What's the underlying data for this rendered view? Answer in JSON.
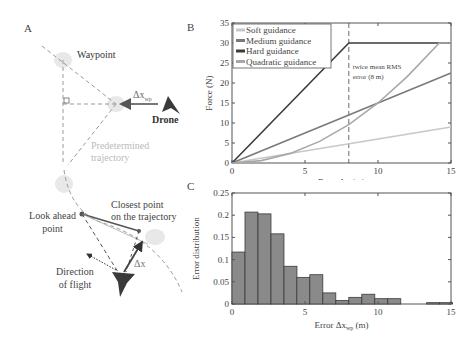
{
  "panels": {
    "a": {
      "label": "A",
      "waypoint_label": "Waypoint",
      "delta_x_wp_label": "Δx",
      "delta_x_wp_sub": "wp",
      "drone_label": "Drone",
      "trajectory_label_line1": "Predetermined",
      "trajectory_label_line2": "trajectory",
      "look_ahead_line1": "Look ahead",
      "look_ahead_line2": "point",
      "closest_point_line1": "Closest point",
      "closest_point_line2": "on the trajectory",
      "delta_x_label": "Δx",
      "direction_line1": "Direction",
      "direction_line2": "of flight"
    },
    "b": {
      "label": "B"
    },
    "c": {
      "label": "C"
    }
  },
  "colors": {
    "soft": "#c8c8c8",
    "medium": "#7a7a7a",
    "hard": "#3c3c3c",
    "quadratic": "#a8a8a8",
    "bar_fill": "#8a8a8a",
    "bar_edge": "#3a3a3a",
    "drone": "#3a3a3a",
    "waypoint_blob": "#e6e6e6"
  },
  "chart_data": [
    {
      "type": "line",
      "panel": "B",
      "title": "",
      "xlabel": "Error Δx (m)",
      "ylabel": "Force (N)",
      "xlim": [
        0,
        15
      ],
      "ylim": [
        0,
        35
      ],
      "xticks": [
        0,
        5,
        10,
        15
      ],
      "yticks": [
        0,
        5,
        10,
        15,
        20,
        25,
        30,
        35
      ],
      "grid": false,
      "legend_position": "upper left",
      "series": [
        {
          "name": "Soft guidance",
          "x": [
            0,
            15
          ],
          "values": [
            0,
            9
          ]
        },
        {
          "name": "Medium guidance",
          "x": [
            0,
            15
          ],
          "values": [
            0,
            22.5
          ]
        },
        {
          "name": "Hard guidance",
          "x": [
            0,
            8,
            15
          ],
          "values": [
            0,
            30,
            30
          ]
        },
        {
          "name": "Quadratic guidance",
          "x": [
            0,
            2,
            4,
            6,
            8,
            10,
            12,
            14.2,
            15
          ],
          "values": [
            0,
            0.6,
            2.4,
            5.4,
            9.6,
            15,
            21.6,
            30,
            30
          ]
        }
      ],
      "annotations": [
        {
          "x": 8,
          "type": "vline-dashed",
          "text_line1": "twice mean RMS",
          "text_line2": "error (8 m)"
        }
      ]
    },
    {
      "type": "bar",
      "panel": "C",
      "title": "",
      "xlabel": "Error Δx",
      "xlabel_sub": "wp",
      "xlabel_unit": " (m)",
      "ylabel": "Error distribution",
      "xlim": [
        0,
        15
      ],
      "ylim": [
        0,
        0.25
      ],
      "xticks": [
        0,
        5,
        10,
        15
      ],
      "yticks": [
        0,
        0.05,
        0.1,
        0.15,
        0.2,
        0.25
      ],
      "ytick_labels": [
        "0",
        "0.05",
        "0.1",
        "0.15",
        "0.2",
        "0.25"
      ],
      "grid": false,
      "bin_width": 0.89,
      "bin_starts": [
        0,
        0.89,
        1.78,
        2.67,
        3.56,
        4.44,
        5.33,
        6.22,
        7.11,
        8.0,
        8.89,
        9.78,
        10.67,
        11.56,
        12.44,
        13.33,
        14.22
      ],
      "values": [
        0.117,
        0.207,
        0.203,
        0.158,
        0.085,
        0.06,
        0.066,
        0.025,
        0.008,
        0.015,
        0.022,
        0.012,
        0.012,
        0,
        0,
        0.003,
        0.003
      ]
    }
  ]
}
